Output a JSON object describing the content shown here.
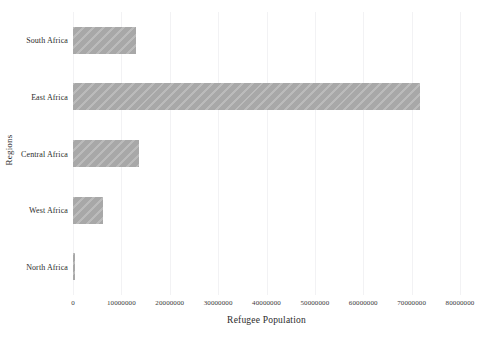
{
  "chart_data": {
    "type": "bar",
    "orientation": "horizontal",
    "title": "",
    "xlabel": "Refugee Population",
    "ylabel": "Regions",
    "categories": [
      "North Africa",
      "West Africa",
      "Central Africa",
      "East Africa",
      "South Africa"
    ],
    "values": [
      400000,
      6200000,
      13600000,
      71700000,
      13000000
    ],
    "xlim": [
      0,
      80000000
    ],
    "xticks": [
      0,
      10000000,
      20000000,
      30000000,
      40000000,
      50000000,
      60000000,
      70000000,
      80000000
    ],
    "xtick_labels": [
      "0",
      "10000000",
      "20000000",
      "30000000",
      "40000000",
      "50000000",
      "60000000",
      "70000000",
      "80000000"
    ],
    "grid": "vertical-only",
    "legend": "none",
    "bar_color": "#a8a8a8",
    "bar_hatch": "diagonal",
    "grid_color": "#f2f2f4",
    "background_color": "#ffffff"
  },
  "axes": {
    "x_title": "Refugee Population",
    "y_title": "Regions"
  },
  "bars": [
    {
      "label": "South Africa",
      "value": 13000000
    },
    {
      "label": "East Africa",
      "value": 71700000
    },
    {
      "label": "Central Africa",
      "value": 13600000
    },
    {
      "label": "West Africa",
      "value": 6200000
    },
    {
      "label": "North Africa",
      "value": 400000
    }
  ]
}
